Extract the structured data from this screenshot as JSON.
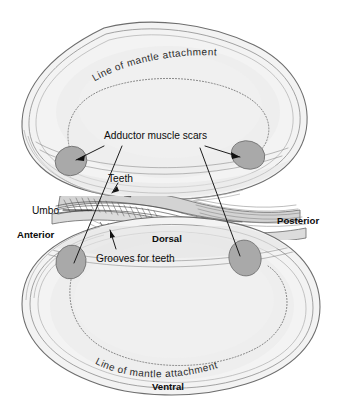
{
  "figure": {
    "background_color": "#ffffff",
    "ink_color": "#0c0c0c",
    "shell_fill": "#f2f2f2",
    "shell_inner_fill": "#ececec",
    "scar_fill": "#a9a9a9",
    "hinge_fill": "#c9c9c9"
  },
  "labels": {
    "mantle_line_top": "Line of mantle attachment",
    "mantle_line_bottom": "Line of mantle attachment",
    "adductor_muscle_scars": "Adductor muscle scars",
    "teeth": "Teeth",
    "umbo": "Umbo",
    "grooves_for_teeth": "Grooves for teeth",
    "anterior": "Anterior",
    "posterior": "Posterior",
    "dorsal": "Dorsal",
    "ventral": "Ventral"
  },
  "parts": {
    "upper_valve": "upper valve",
    "lower_valve": "lower valve",
    "anterior_adductor_scar_upper": "anterior adductor muscle scar, upper valve",
    "posterior_adductor_scar_upper": "posterior adductor muscle scar, upper valve",
    "anterior_adductor_scar_lower": "anterior adductor muscle scar, lower valve",
    "posterior_adductor_scar_lower": "posterior adductor muscle scar, lower valve",
    "hinge": "hinge region with teeth and grooves",
    "pallial_line_upper": "pallial line, upper valve",
    "pallial_line_lower": "pallial line, lower valve"
  }
}
